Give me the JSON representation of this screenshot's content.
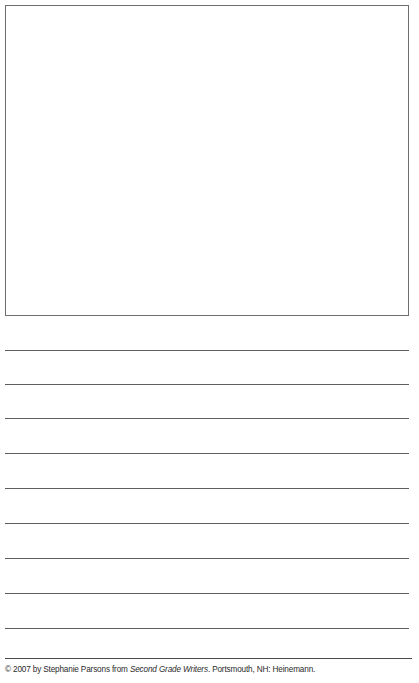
{
  "page": {
    "kind": "primary-writing-worksheet",
    "background_color": "#ffffff",
    "width": 419,
    "height": 683
  },
  "drawing_box": {
    "label": "",
    "content": "",
    "border_color": "#6e6e6e",
    "fill_color": "#ffffff"
  },
  "writing_area": {
    "line_color": "#5f5f5f",
    "line_count": 9,
    "lines": [
      {
        "index": 1,
        "text": "",
        "y": 34
      },
      {
        "index": 2,
        "text": "",
        "y": 68
      },
      {
        "index": 3,
        "text": "",
        "y": 102
      },
      {
        "index": 4,
        "text": "",
        "y": 137
      },
      {
        "index": 5,
        "text": "",
        "y": 172
      },
      {
        "index": 6,
        "text": "",
        "y": 207
      },
      {
        "index": 7,
        "text": "",
        "y": 242
      },
      {
        "index": 8,
        "text": "",
        "y": 277
      },
      {
        "index": 9,
        "text": "",
        "y": 312
      }
    ]
  },
  "footer": {
    "rule_color": "#4a4a4a",
    "credit": {
      "prefix": "© 2007 by Stephanie Parsons from ",
      "book_title": "Second Grade Writers",
      "suffix": ". Portsmouth, NH: Heinemann.",
      "full_text": "© 2007 by Stephanie Parsons from Second Grade Writers. Portsmouth, NH: Heinemann.",
      "copyright_symbol": "©",
      "year": "2007",
      "author": "Stephanie Parsons",
      "publisher": "Heinemann",
      "publisher_city": "Portsmouth, NH"
    }
  }
}
